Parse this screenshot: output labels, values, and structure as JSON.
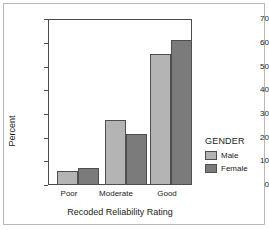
{
  "chart_data": {
    "type": "bar",
    "title": "",
    "xlabel": "Recoded Reliability Rating",
    "ylabel": "Percent",
    "categories": [
      "Poor",
      "Moderate",
      "Good"
    ],
    "series": [
      {
        "name": "Male",
        "values": [
          6.0,
          27.4,
          55.3
        ],
        "color": "#b4b4b4"
      },
      {
        "name": "Female",
        "values": [
          7.3,
          21.5,
          61.2
        ],
        "color": "#7b7b7b"
      }
    ],
    "ylim": [
      0,
      70
    ],
    "yticks": [
      0,
      10,
      20,
      30,
      40,
      50,
      60,
      70
    ],
    "ytick_labels": [
      "0",
      "10",
      "20",
      "30",
      "40",
      "50",
      "60",
      "70"
    ],
    "grid": false,
    "legend_position": "right",
    "legend_title": "GENDER"
  },
  "axes": {
    "y_title": "Percent",
    "x_title": "Recoded Reliability Rating",
    "y_tick_0": "0",
    "y_tick_10": "10",
    "y_tick_20": "20",
    "y_tick_30": "30",
    "y_tick_40": "40",
    "y_tick_50": "50",
    "y_tick_60": "60",
    "y_tick_70": "70",
    "x_tick_poor": "Poor",
    "x_tick_moderate": "Moderate",
    "x_tick_good": "Good"
  },
  "legend": {
    "title": "GENDER",
    "male_label": "Male",
    "female_label": "Female"
  },
  "colors": {
    "male_bar": "#b4b4b4",
    "female_bar": "#7b7b7b",
    "axis": "#4a4a4a",
    "text": "#1a1a1a",
    "background": "#ffffff"
  }
}
